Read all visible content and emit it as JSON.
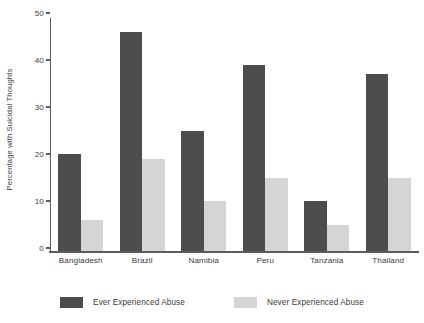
{
  "chart_data": {
    "type": "bar",
    "title": "",
    "subtitle": "",
    "xlabel": "",
    "ylabel": "Percentage with Suicidal Thoughts",
    "categories": [
      "Bangladesh",
      "Brazil",
      "Namibia",
      "Peru",
      "Tanzania",
      "Thailand"
    ],
    "series": [
      {
        "name": "Ever Experienced Abuse",
        "color": "#4d4d4d",
        "values": [
          21,
          47,
          26,
          40,
          11,
          38
        ]
      },
      {
        "name": "Never Experienced Abuse",
        "color": "#d5d5d5",
        "values": [
          7,
          20,
          11,
          16,
          6,
          16
        ]
      }
    ],
    "ylim": [
      0,
      50
    ],
    "yticks": [
      0,
      10,
      20,
      30,
      40,
      50
    ],
    "ytick_labels": [
      "0",
      "10",
      "20",
      "30",
      "40",
      "50"
    ],
    "grid": false,
    "legend_position": "bottom",
    "value_unit": "percent"
  },
  "axes": {
    "y_title": "Percentage with Suicidal Thoughts",
    "y_ticks": [
      {
        "value": 50,
        "label": "50"
      },
      {
        "value": 40,
        "label": "40"
      },
      {
        "value": 30,
        "label": "30"
      },
      {
        "value": 20,
        "label": "20"
      },
      {
        "value": 10,
        "label": "10"
      },
      {
        "value": 0,
        "label": "0"
      }
    ],
    "x_categories": [
      {
        "label": "Bangladesh"
      },
      {
        "label": "Brazil"
      },
      {
        "label": "Namibia"
      },
      {
        "label": "Peru"
      },
      {
        "label": "Tanzania"
      },
      {
        "label": "Thailand"
      }
    ]
  },
  "legend": {
    "items": [
      {
        "label": "Ever Experienced Abuse",
        "color": "#4d4d4d"
      },
      {
        "label": "Never Experienced Abuse",
        "color": "#d5d5d5"
      }
    ]
  },
  "colors": {
    "ever_abuse": "#4d4d4d",
    "never_abuse": "#d5d5d5",
    "axis": "#5d5d5d",
    "text": "#3d3d3d",
    "background": "#ffffff"
  }
}
